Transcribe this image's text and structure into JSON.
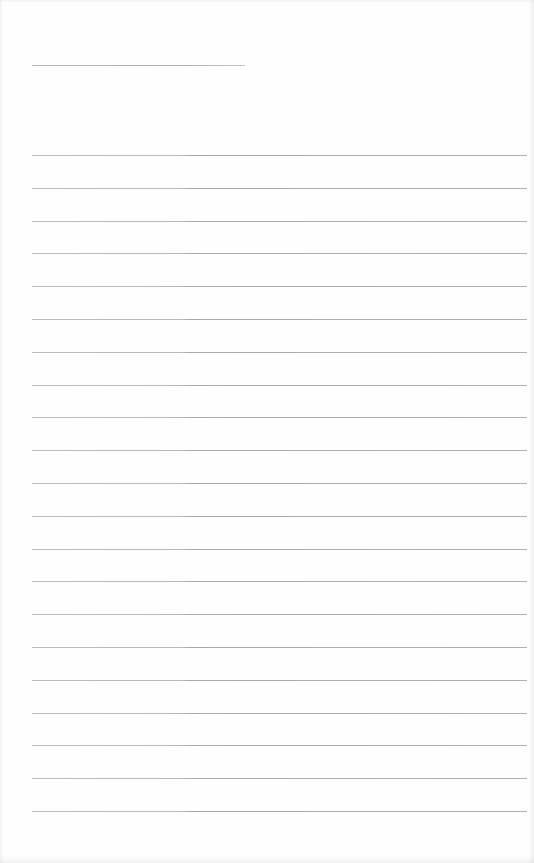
{
  "page": {
    "type": "blank lined sheet",
    "background_color": "#fefefe",
    "line_color": "#b4b4b4"
  },
  "title_line": {
    "text": ""
  },
  "lines": [
    {
      "text": ""
    },
    {
      "text": ""
    },
    {
      "text": ""
    },
    {
      "text": ""
    },
    {
      "text": ""
    },
    {
      "text": ""
    },
    {
      "text": ""
    },
    {
      "text": ""
    },
    {
      "text": ""
    },
    {
      "text": ""
    },
    {
      "text": ""
    },
    {
      "text": ""
    },
    {
      "text": ""
    },
    {
      "text": ""
    },
    {
      "text": ""
    },
    {
      "text": ""
    },
    {
      "text": ""
    },
    {
      "text": ""
    },
    {
      "text": ""
    },
    {
      "text": ""
    },
    {
      "text": ""
    }
  ]
}
